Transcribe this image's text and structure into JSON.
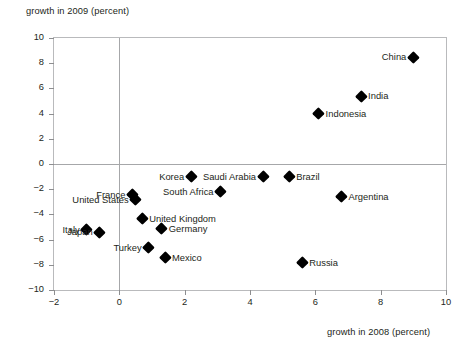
{
  "chart_data": {
    "type": "scatter",
    "title": "",
    "xlabel": "growth in 2008 (percent)",
    "ylabel": "growth in 2009 (percent)",
    "xlim": [
      -2,
      10
    ],
    "ylim": [
      -10,
      10
    ],
    "xticks": [
      -2,
      0,
      2,
      4,
      6,
      8,
      10
    ],
    "yticks": [
      -10,
      -8,
      -6,
      -4,
      -2,
      0,
      2,
      4,
      6,
      8,
      10
    ],
    "xticklabels": [
      "−2",
      "0",
      "2",
      "4",
      "6",
      "8",
      "10"
    ],
    "yticklabels": [
      "10",
      "8",
      "6",
      "4",
      "2",
      "0",
      "−2",
      "−4",
      "−6",
      "−8",
      "−10"
    ],
    "grid": false,
    "legend": null,
    "zero_lines": {
      "x": 0,
      "y": 0
    },
    "marker_color": "#000000",
    "marker_shape": "diamond",
    "points": [
      {
        "name": "China",
        "x": 9.0,
        "y": 8.5,
        "label_side": "left"
      },
      {
        "name": "India",
        "x": 7.4,
        "y": 5.4,
        "label_side": "right"
      },
      {
        "name": "Indonesia",
        "x": 6.1,
        "y": 4.0,
        "label_side": "right"
      },
      {
        "name": "Brazil",
        "x": 5.2,
        "y": -1.0,
        "label_side": "right"
      },
      {
        "name": "Saudi Arabia",
        "x": 4.4,
        "y": -1.0,
        "label_side": "left"
      },
      {
        "name": "Korea",
        "x": 2.2,
        "y": -1.0,
        "label_side": "left"
      },
      {
        "name": "South Africa",
        "x": 3.1,
        "y": -2.2,
        "label_side": "left"
      },
      {
        "name": "Argentina",
        "x": 6.8,
        "y": -2.6,
        "label_side": "right"
      },
      {
        "name": "France",
        "x": 0.4,
        "y": -2.4,
        "label_side": "left"
      },
      {
        "name": "United States",
        "x": 0.5,
        "y": -2.8,
        "label_side": "left"
      },
      {
        "name": "United Kingdom",
        "x": 0.7,
        "y": -4.3,
        "label_side": "right"
      },
      {
        "name": "Germany",
        "x": 1.3,
        "y": -5.1,
        "label_side": "right"
      },
      {
        "name": "Italy",
        "x": -1.0,
        "y": -5.2,
        "label_side": "left"
      },
      {
        "name": "Japan",
        "x": -0.6,
        "y": -5.4,
        "label_side": "left"
      },
      {
        "name": "Turkey",
        "x": 0.9,
        "y": -6.6,
        "label_side": "left"
      },
      {
        "name": "Mexico",
        "x": 1.4,
        "y": -7.4,
        "label_side": "right"
      },
      {
        "name": "Russia",
        "x": 5.6,
        "y": -7.8,
        "label_side": "right"
      }
    ]
  }
}
